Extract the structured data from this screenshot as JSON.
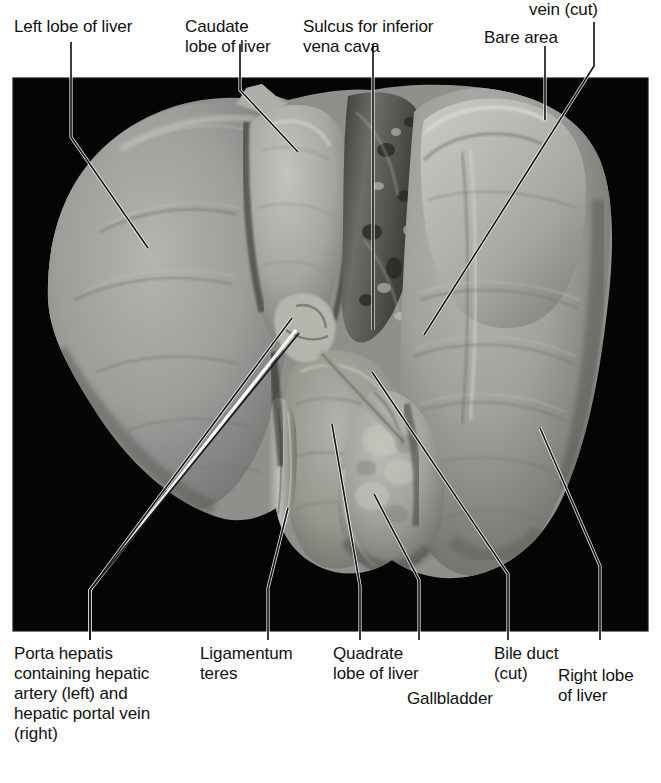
{
  "figure": {
    "type": "anatomical-photograph",
    "background_color": "#ffffff",
    "photo": {
      "x": 13,
      "y": 78,
      "width": 635,
      "height": 553,
      "background_color": "#050505",
      "tissue_color": "#9c9c9c",
      "border_color": "#000000"
    },
    "leader_line_color": "#1a1a1a",
    "leader_line_halo_color": "#ffffff"
  },
  "labels": {
    "top": [
      {
        "id": "left-lobe",
        "text": "Left lobe of liver",
        "lines": [
          "Left lobe of liver"
        ]
      },
      {
        "id": "caudate",
        "text": "Caudate lobe of liver",
        "lines": [
          "Caudate",
          "lobe of liver"
        ]
      },
      {
        "id": "sulcus",
        "text": "Sulcus for inferior vena cava",
        "lines": [
          "Sulcus for inferior",
          "vena cava"
        ]
      },
      {
        "id": "bare-area",
        "text": "Bare area",
        "lines": [
          "Bare area"
        ]
      },
      {
        "id": "hepatic-vein",
        "text": "vein (cut)",
        "lines": [
          "vein (cut)"
        ]
      }
    ],
    "bottom": [
      {
        "id": "porta-hepatis",
        "text": "Porta hepatis containing hepatic artery (left) and hepatic portal vein (right)",
        "lines": [
          "Porta hepatis",
          "containing hepatic",
          "artery (left) and",
          "hepatic portal vein",
          "(right)"
        ]
      },
      {
        "id": "ligamentum-teres",
        "text": "Ligamentum teres",
        "lines": [
          "Ligamentum",
          "teres"
        ]
      },
      {
        "id": "quadrate-lobe",
        "text": "Quadrate lobe of liver",
        "lines": [
          "Quadrate",
          "lobe of liver"
        ]
      },
      {
        "id": "bile-duct",
        "text": "Bile duct (cut)",
        "lines": [
          "Bile duct",
          "(cut)"
        ]
      },
      {
        "id": "gallbladder",
        "text": "Gallbladder",
        "lines": [
          "Gallbladder"
        ]
      },
      {
        "id": "right-lobe",
        "text": "Right lobe of liver",
        "lines": [
          "Right lobe",
          "of liver"
        ]
      }
    ]
  },
  "captions": {
    "left_lobe": "Left lobe of liver",
    "caudate_l1": "Caudate",
    "caudate_l2": "lobe of liver",
    "sulcus_l1": "Sulcus for inferior",
    "sulcus_l2": "vena cava",
    "bare_area": "Bare area",
    "hepatic_vein": "vein (cut)",
    "porta_l1": "Porta hepatis",
    "porta_l2": "containing hepatic",
    "porta_l3": "artery (left) and",
    "porta_l4": "hepatic portal vein",
    "porta_l5": "(right)",
    "ligamentum_l1": "Ligamentum",
    "ligamentum_l2": "teres",
    "quadrate_l1": "Quadrate",
    "quadrate_l2": "lobe of liver",
    "bile_l1": "Bile duct",
    "bile_l2": "(cut)",
    "gallbladder": "Gallbladder",
    "rightlobe_l1": "Right lobe",
    "rightlobe_l2": "of liver"
  }
}
